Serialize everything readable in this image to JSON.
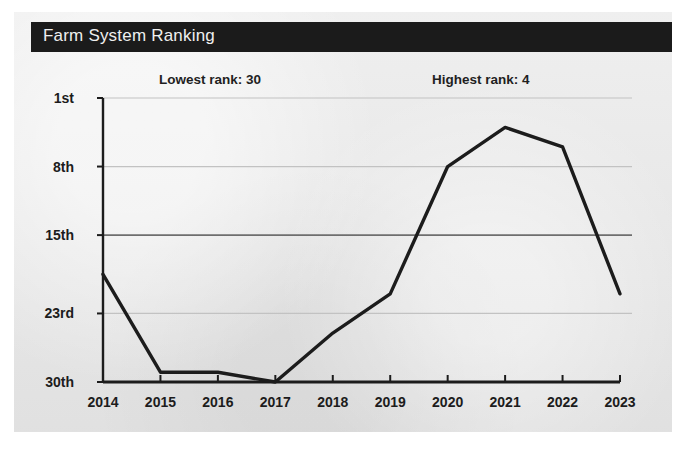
{
  "card": {
    "title": "Farm System Ranking"
  },
  "annotations": {
    "lowest": "Lowest rank: 30",
    "highest": "Highest rank: 4"
  },
  "chart_data": {
    "type": "line",
    "title": "Farm System Ranking",
    "xlabel": "",
    "ylabel": "",
    "x": [
      "2014",
      "2015",
      "2016",
      "2017",
      "2018",
      "2019",
      "2020",
      "2021",
      "2022",
      "2023"
    ],
    "categories": [
      "2014",
      "2015",
      "2016",
      "2017",
      "2018",
      "2019",
      "2020",
      "2021",
      "2022",
      "2023"
    ],
    "values": [
      19,
      29,
      29,
      30,
      25,
      21,
      8,
      4,
      6,
      21
    ],
    "series": [
      {
        "name": "Farm system rank",
        "values": [
          19,
          29,
          29,
          30,
          25,
          21,
          8,
          4,
          6,
          21
        ]
      }
    ],
    "ytick_labels": [
      "1st",
      "8th",
      "15th",
      "23rd",
      "30th"
    ],
    "ytick_values": [
      1,
      8,
      15,
      23,
      30
    ],
    "ylim": [
      1,
      30
    ],
    "y_inverted": true,
    "grid": true,
    "legend": "none",
    "line_color": "#1c1c1c",
    "annotations": [
      {
        "text": "Lowest rank: 30",
        "at_x": "2017",
        "value": 30
      },
      {
        "text": "Highest rank: 4",
        "at_x": "2021",
        "value": 4
      }
    ]
  }
}
